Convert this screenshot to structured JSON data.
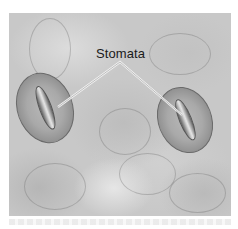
{
  "figure": {
    "label": "Stomata",
    "label_color": "#1a1a1a",
    "leader_line_color": "#f2f2f2",
    "background_tone": "#c8c8c8",
    "stomata": [
      {
        "name": "left-stoma",
        "cx": 45,
        "cy": 108,
        "rx": 28,
        "ry": 36,
        "rotate": -20
      },
      {
        "name": "right-stoma",
        "cx": 184,
        "cy": 120,
        "rx": 27,
        "ry": 34,
        "rotate": -22
      }
    ]
  }
}
